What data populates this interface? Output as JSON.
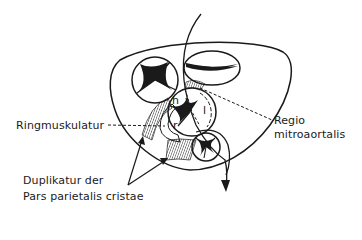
{
  "figure": {
    "type": "anatomical line drawing",
    "stroke_color": "#1a1a1a",
    "background": "#ffffff"
  },
  "labels": {
    "ringmuskulatur": "Ringmuskulatur",
    "regio_line1": "Regio",
    "regio_line2": "mitroaortalis",
    "duplikatur_line1": "Duplikatur der",
    "duplikatur_line2": "Pars parietalis cristae"
  },
  "inner_letters": {
    "h": "h",
    "l": "l",
    "r": "r"
  },
  "structures": [
    {
      "name": "upper-left-valve",
      "shape": "circle with three cusps"
    },
    {
      "name": "upper-right-valve",
      "shape": "ellipse with two cusps"
    },
    {
      "name": "central-valve",
      "shape": "circle with three cusps labelled h, l, r"
    },
    {
      "name": "lower-valve",
      "shape": "small circle with three cusps"
    },
    {
      "name": "outer-ring",
      "shape": "rounded triangular outline"
    },
    {
      "name": "flow-arrow",
      "shape": "curved arrow from top through center to bottom"
    }
  ]
}
